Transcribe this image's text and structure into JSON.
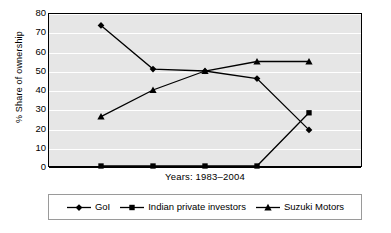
{
  "chart_data": {
    "type": "line",
    "title": "",
    "xlabel": "Years: 1983–2004",
    "ylabel": "% Share of ownership",
    "ylim": [
      0,
      80
    ],
    "ytick_labels": [
      "80",
      "70",
      "60",
      "50",
      "40",
      "30",
      "20",
      "10",
      "0"
    ],
    "yticks": [
      80,
      70,
      60,
      50,
      40,
      30,
      20,
      10,
      0
    ],
    "grid": true,
    "legend_position": "bottom",
    "x": [
      1,
      2,
      3,
      4,
      5
    ],
    "categories": [
      "",
      "",
      "",
      "",
      ""
    ],
    "series": [
      {
        "name": "GoI",
        "marker": "diamond",
        "color": "#000000",
        "values": [
          74,
          51,
          50,
          46,
          19
        ]
      },
      {
        "name": "Indian private investors",
        "marker": "square",
        "color": "#000000",
        "values": [
          0,
          0,
          0,
          0,
          28
        ]
      },
      {
        "name": "Suzuki Motors",
        "marker": "triangle",
        "color": "#000000",
        "values": [
          26,
          40,
          50,
          55,
          55
        ]
      }
    ]
  },
  "axes": {
    "y_title": "% Share of ownership",
    "x_title": "Years: 1983–2004"
  },
  "legend": {
    "items": [
      {
        "label": "GoI",
        "marker": "diamond-marker-icon"
      },
      {
        "label": "Indian private investors",
        "marker": "square-marker-icon"
      },
      {
        "label": "Suzuki Motors",
        "marker": "triangle-marker-icon"
      }
    ]
  },
  "colors": {
    "plot_background": "#e6e6e6",
    "gridline": "#ffffff",
    "axis": "#000000",
    "series": "#000000",
    "legend_border": "#9a9a9a",
    "page_background": "#ffffff"
  }
}
